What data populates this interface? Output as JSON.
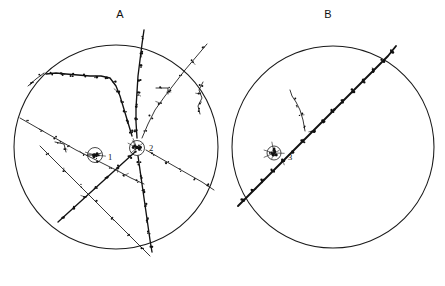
{
  "figure": {
    "caption_absent": true,
    "background_color": "#ffffff",
    "ink_color": "#121212",
    "width": 445,
    "height": 286
  },
  "panels": [
    {
      "id": "panel-a",
      "label": "A",
      "label_x": 120,
      "label_y": 18,
      "field_of_view": {
        "cx": 116,
        "cy": 147,
        "r": 102
      },
      "description": "multiple particle tracks radiating from a central star vertex plus an isolated interaction vertex",
      "vertices": [
        {
          "name": "1",
          "cx": 95,
          "cy": 155,
          "r": 7.5,
          "label_x": 108,
          "label_y": 160,
          "type": "isolated-star"
        },
        {
          "name": "2",
          "cx": 137,
          "cy": 148,
          "r": 7.5,
          "label_x": 149,
          "label_y": 151,
          "type": "multi-prong-star"
        }
      ]
    },
    {
      "id": "panel-b",
      "label": "B",
      "label_x": 328,
      "label_y": 18,
      "field_of_view": {
        "cx": 333,
        "cy": 147,
        "r": 101
      },
      "description": "single heavy diagonal track crossing the field of view with one branch point",
      "vertices": [
        {
          "name": "3",
          "cx": 274,
          "cy": 153,
          "r": 7.0,
          "label_x": 288,
          "label_y": 160,
          "type": "branch-point"
        }
      ]
    }
  ],
  "chart_data": {
    "type": "scatter",
    "title": "",
    "xlabel": "",
    "ylabel": "",
    "grid": false,
    "legend_position": "none",
    "panel_labels": [
      "A",
      "B"
    ],
    "vertex_labels": [
      "1",
      "2",
      "3"
    ],
    "tracks_panel_a": 9,
    "tracks_panel_b": 2
  },
  "tracks": {
    "panel_a": [
      {
        "name": "track-a-upper-vertical",
        "weight": "med",
        "path": "M144,30 L142,44 L140,60 L138,76 L137,92 L136,108 L136,122 L137,138",
        "grains": [
          [
            143,
            38
          ],
          [
            141,
            52
          ],
          [
            140,
            66
          ],
          [
            139,
            80
          ],
          [
            138,
            94
          ],
          [
            137,
            106
          ],
          [
            136,
            118
          ],
          [
            136,
            130
          ]
        ]
      },
      {
        "name": "track-a-ne-diagonal",
        "weight": "thin",
        "path": "M207,44 L196,57 L185,70 L175,83 L165,96 L155,110 L148,124 L142,138",
        "grains": [
          [
            203,
            48
          ],
          [
            192,
            61
          ],
          [
            181,
            75
          ],
          [
            170,
            89
          ],
          [
            160,
            103
          ],
          [
            151,
            117
          ],
          [
            145,
            130
          ]
        ]
      },
      {
        "name": "track-a-nw-branch-main",
        "weight": "med",
        "path": "M46,74 L56,73 L66,74 L78,75 L90,76 L101,76 L110,78 L116,86 L120,96 L123,106 L126,116 L129,126 L132,136",
        "grains": [
          [
            52,
            73
          ],
          [
            62,
            74
          ],
          [
            72,
            75
          ],
          [
            84,
            76
          ],
          [
            96,
            76
          ],
          [
            106,
            77
          ],
          [
            114,
            82
          ],
          [
            118,
            92
          ],
          [
            122,
            102
          ],
          [
            125,
            112
          ],
          [
            128,
            122
          ],
          [
            131,
            132
          ]
        ]
      },
      {
        "name": "track-a-nw-short-stub",
        "weight": "thin",
        "path": "M44,73 L36,79 L28,86",
        "grains": [
          [
            40,
            76
          ],
          [
            32,
            82
          ]
        ]
      },
      {
        "name": "track-a-sw-long-diagonal",
        "weight": "thin",
        "path": "M20,118 L34,126 L48,134 L62,142 L76,150 L90,157 L104,164 L118,171 L131,178 L144,184",
        "grains": [
          [
            27,
            122
          ],
          [
            41,
            130
          ],
          [
            55,
            138
          ],
          [
            69,
            146
          ],
          [
            83,
            154
          ],
          [
            97,
            161
          ],
          [
            111,
            168
          ],
          [
            125,
            175
          ],
          [
            138,
            181
          ]
        ]
      },
      {
        "name": "track-a-sw-from-vertex",
        "weight": "med",
        "path": "M135,152 L124,162 L113,172 L102,182 L91,192 L80,202 L69,212 L58,222",
        "grains": [
          [
            130,
            157
          ],
          [
            118,
            167
          ],
          [
            107,
            177
          ],
          [
            96,
            187
          ],
          [
            85,
            197
          ],
          [
            74,
            207
          ],
          [
            63,
            217
          ]
        ]
      },
      {
        "name": "track-a-s-from-vertex",
        "weight": "med",
        "path": "M138,156 L140,170 L142,184 L144,198 L146,212 L148,226 L150,240 L152,252",
        "grains": [
          [
            139,
            163
          ],
          [
            141,
            177
          ],
          [
            143,
            191
          ],
          [
            145,
            205
          ],
          [
            147,
            219
          ],
          [
            149,
            233
          ],
          [
            151,
            246
          ]
        ]
      },
      {
        "name": "track-a-se-from-vertex",
        "weight": "thin",
        "path": "M146,150 L160,158 L174,166 L188,174 L202,182 L214,190",
        "grains": [
          [
            153,
            154
          ],
          [
            167,
            162
          ],
          [
            181,
            170
          ],
          [
            195,
            178
          ],
          [
            208,
            186
          ]
        ]
      },
      {
        "name": "track-a-sw-steep-crossing",
        "weight": "thin",
        "path": "M40,146 L56,162 L72,178 L88,194 L104,210 L120,226 L136,242 L150,256",
        "grains": [
          [
            48,
            154
          ],
          [
            64,
            170
          ],
          [
            80,
            186
          ],
          [
            96,
            202
          ],
          [
            112,
            218
          ],
          [
            128,
            234
          ],
          [
            143,
            249
          ]
        ]
      },
      {
        "name": "track-a-right-edge-zigzag",
        "weight": "thin",
        "path": "M203,82 L199,90 L202,98 L198,106 L200,114",
        "grains": [
          [
            201,
            86
          ],
          [
            200,
            94
          ],
          [
            200,
            102
          ],
          [
            199,
            110
          ]
        ]
      },
      {
        "name": "track-a-mid-hook",
        "weight": "thin",
        "path": "M156,88 L168,88 L168,94",
        "grains": [
          [
            161,
            88
          ],
          [
            168,
            91
          ]
        ]
      },
      {
        "name": "track-a-small-hook-left",
        "weight": "thin",
        "path": "M55,142 L64,144 L66,152",
        "grains": [
          [
            59,
            143
          ],
          [
            65,
            148
          ]
        ]
      }
    ],
    "panel_b": [
      {
        "name": "track-b-main-diagonal",
        "weight": "heavy",
        "path": "M238,206 L248,196 L258,186 L268,176 L278,166 L288,156 L298,146 L308,136 L318,126 L328,116 L338,106 L348,96 L358,86 L368,76 L378,66 L388,56 L396,46",
        "grains": [
          [
            243,
            201
          ],
          [
            253,
            191
          ],
          [
            263,
            181
          ],
          [
            273,
            171
          ],
          [
            283,
            161
          ],
          [
            293,
            151
          ],
          [
            303,
            141
          ],
          [
            313,
            131
          ],
          [
            323,
            121
          ],
          [
            333,
            111
          ],
          [
            343,
            101
          ],
          [
            353,
            91
          ],
          [
            363,
            81
          ],
          [
            373,
            71
          ],
          [
            383,
            61
          ],
          [
            392,
            51
          ]
        ]
      },
      {
        "name": "track-b-branch",
        "weight": "thin",
        "path": "M305,131 L303,120 L300,110 L296,102 L292,96 L290,90",
        "grains": [
          [
            304,
            126
          ],
          [
            301,
            115
          ],
          [
            298,
            106
          ],
          [
            294,
            99
          ]
        ]
      }
    ]
  }
}
